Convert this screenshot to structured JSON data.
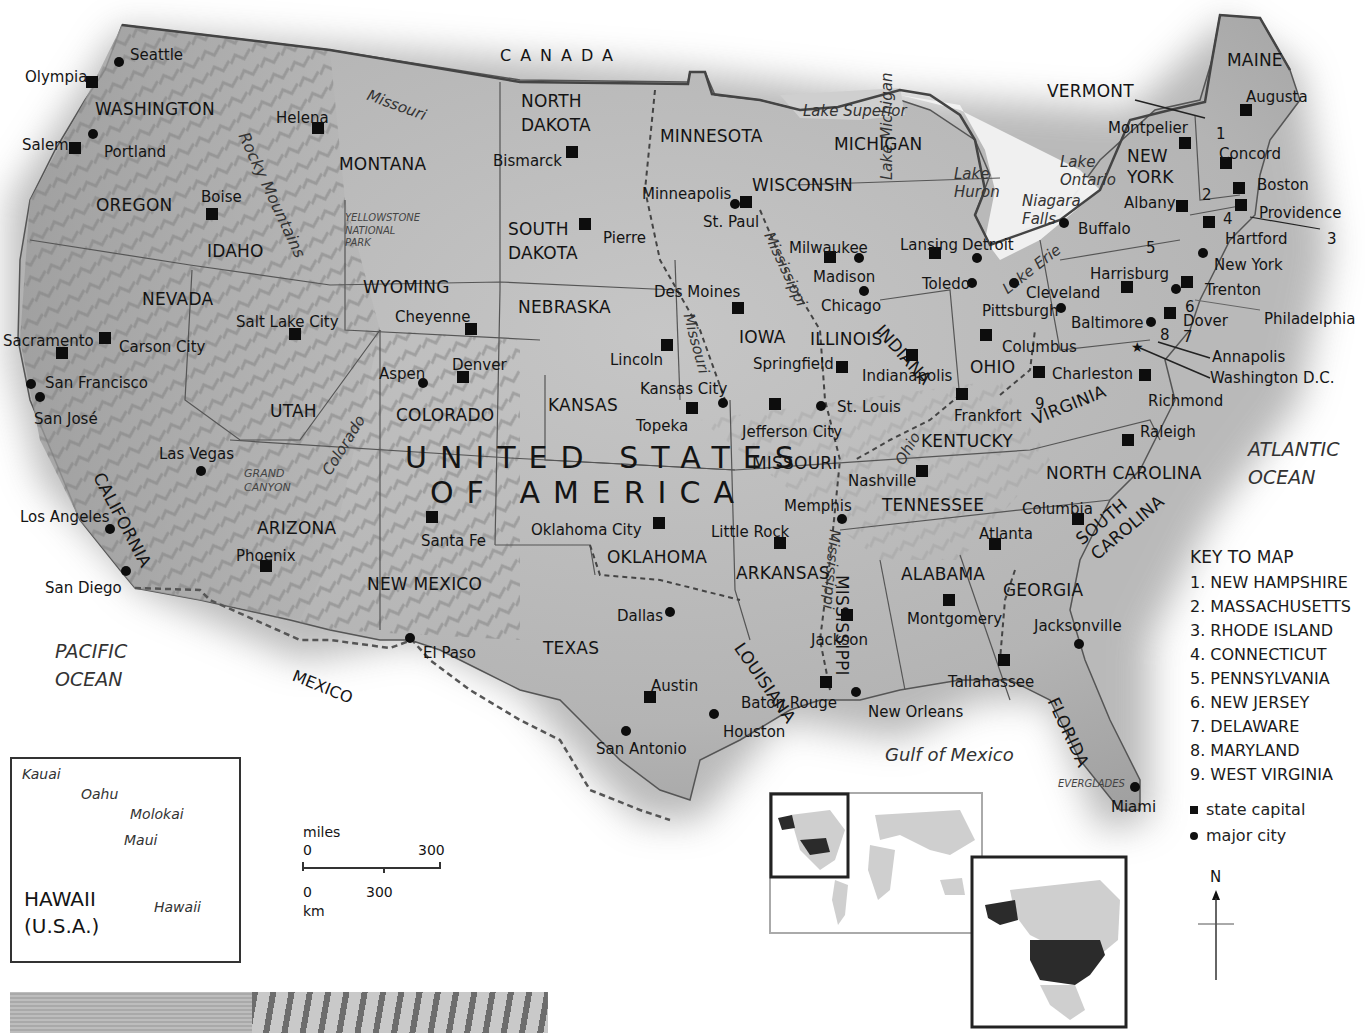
{
  "map": {
    "title": "UNITED STATES OF AMERICA",
    "title_line1": "UNITED STATES",
    "title_line2": "OF AMERICA",
    "neighbors": {
      "north": "CANADA",
      "south": "MEXICO"
    },
    "water_bodies": {
      "pacific_ocean": [
        "PACIFIC",
        "OCEAN"
      ],
      "atlantic_ocean": [
        "ATLANTIC",
        "OCEAN"
      ],
      "gulf": "Gulf of Mexico",
      "lake_superior": "Lake Superior",
      "lake_michigan": "Lake Michigan",
      "lake_huron": [
        "Lake",
        "Huron"
      ],
      "lake_ontario": [
        "Lake",
        "Ontario"
      ],
      "lake_erie": "Lake Erie",
      "niagara_falls": [
        "Niagara",
        "Falls"
      ]
    },
    "rivers": [
      "Missouri",
      "Missouri",
      "Mississippi",
      "Mississippi",
      "Colorado",
      "Ohio"
    ],
    "mountains": "Rocky Mountains",
    "regions": {
      "yellowstone": [
        "YELLOWSTONE",
        "NATIONAL",
        "PARK"
      ],
      "grand_canyon": [
        "GRAND",
        "CANYON"
      ],
      "everglades": "EVERGLADES"
    },
    "states": [
      {
        "name": "WASHINGTON",
        "x": 95,
        "y": 101
      },
      {
        "name": "OREGON",
        "x": 96,
        "y": 197
      },
      {
        "name": "IDAHO",
        "x": 207,
        "y": 243
      },
      {
        "name": "MONTANA",
        "x": 339,
        "y": 156
      },
      {
        "name": "NEVADA",
        "x": 142,
        "y": 291
      },
      {
        "name": "UTAH",
        "x": 270,
        "y": 403
      },
      {
        "name": "ARIZONA",
        "x": 257,
        "y": 520
      },
      {
        "name": "WYOMING",
        "x": 363,
        "y": 279
      },
      {
        "name": "COLORADO",
        "x": 396,
        "y": 407
      },
      {
        "name": "NEW MEXICO",
        "x": 367,
        "y": 576
      },
      {
        "name": "NORTH",
        "x": 521,
        "y": 93
      },
      {
        "name": "DAKOTA",
        "x": 521,
        "y": 117
      },
      {
        "name": "SOUTH",
        "x": 508,
        "y": 221
      },
      {
        "name": "DAKOTA",
        "x": 508,
        "y": 245
      },
      {
        "name": "NEBRASKA",
        "x": 518,
        "y": 299
      },
      {
        "name": "KANSAS",
        "x": 548,
        "y": 397
      },
      {
        "name": "OKLAHOMA",
        "x": 607,
        "y": 549
      },
      {
        "name": "TEXAS",
        "x": 543,
        "y": 640
      },
      {
        "name": "MINNESOTA",
        "x": 660,
        "y": 128
      },
      {
        "name": "IOWA",
        "x": 739,
        "y": 329
      },
      {
        "name": "MISSOURI",
        "x": 752,
        "y": 455
      },
      {
        "name": "ARKANSAS",
        "x": 736,
        "y": 565
      },
      {
        "name": "WISCONSIN",
        "x": 752,
        "y": 177
      },
      {
        "name": "ILLINOIS",
        "x": 810,
        "y": 331
      },
      {
        "name": "MICHIGAN",
        "x": 834,
        "y": 136
      },
      {
        "name": "OHIO",
        "x": 970,
        "y": 359
      },
      {
        "name": "KENTUCKY",
        "x": 921,
        "y": 433
      },
      {
        "name": "TENNESSEE",
        "x": 882,
        "y": 497
      },
      {
        "name": "ALABAMA",
        "x": 901,
        "y": 566
      },
      {
        "name": "GEORGIA",
        "x": 1003,
        "y": 582
      },
      {
        "name": "NORTH CAROLINA",
        "x": 1046,
        "y": 465
      },
      {
        "name": "NEW",
        "x": 1127,
        "y": 148
      },
      {
        "name": "YORK",
        "x": 1127,
        "y": 169
      },
      {
        "name": "MAINE",
        "x": 1227,
        "y": 52
      },
      {
        "name": "VERMONT",
        "x": 1047,
        "y": 83
      }
    ],
    "rotated_states": [
      {
        "name": "CALIFORNIA",
        "x": 105,
        "y": 470,
        "rot": 62
      },
      {
        "name": "INDIANA",
        "x": 885,
        "y": 322,
        "rot": 48
      },
      {
        "name": "LOUISIANA",
        "x": 745,
        "y": 640,
        "rot": 55
      },
      {
        "name": "MISSISSIPPI",
        "x": 850,
        "y": 575,
        "rot": 90
      },
      {
        "name": "VIRGINIA",
        "x": 1030,
        "y": 412,
        "rot": -22
      },
      {
        "name": "SOUTH",
        "x": 1073,
        "y": 535,
        "rot": -40
      },
      {
        "name": "CAROLINA",
        "x": 1088,
        "y": 550,
        "rot": -40
      },
      {
        "name": "FLORIDA",
        "x": 1060,
        "y": 695,
        "rot": 65
      }
    ],
    "state_numbers": [
      {
        "n": "1",
        "x": 1216,
        "y": 127
      },
      {
        "n": "2",
        "x": 1202,
        "y": 188
      },
      {
        "n": "3",
        "x": 1327,
        "y": 232
      },
      {
        "n": "4",
        "x": 1223,
        "y": 212
      },
      {
        "n": "5",
        "x": 1146,
        "y": 241
      },
      {
        "name_hint": "",
        "n": "6",
        "x": 1185,
        "y": 300
      },
      {
        "n": "7",
        "x": 1183,
        "y": 330
      },
      {
        "n": "8",
        "x": 1160,
        "y": 328
      },
      {
        "n": "9",
        "x": 1035,
        "y": 397
      }
    ],
    "capitals": [
      {
        "name": "Olympia",
        "lx": 25,
        "ly": 70,
        "mx": 92,
        "my": 82
      },
      {
        "name": "Salem",
        "lx": 22,
        "ly": 138,
        "mx": 75,
        "my": 148
      },
      {
        "name": "Helena",
        "lx": 276,
        "ly": 111,
        "mx": 318,
        "my": 128
      },
      {
        "name": "Boise",
        "lx": 201,
        "ly": 190,
        "mx": 212,
        "my": 214
      },
      {
        "name": "Bismarck",
        "lx": 493,
        "ly": 154,
        "mx": 572,
        "my": 152
      },
      {
        "name": "Pierre",
        "lx": 603,
        "ly": 231,
        "mx": 585,
        "my": 224
      },
      {
        "name": "St. Paul",
        "lx": 703,
        "ly": 215,
        "mx": 746,
        "my": 202
      },
      {
        "name": "Cheyenne",
        "lx": 395,
        "ly": 310,
        "mx": 471,
        "my": 329
      },
      {
        "name": "Salt Lake City",
        "lx": 236,
        "ly": 315,
        "mx": 295,
        "my": 334
      },
      {
        "name": "Carson City",
        "lx": 119,
        "ly": 340,
        "mx": 105,
        "my": 338
      },
      {
        "name": "Sacramento",
        "lx": 3,
        "ly": 334,
        "mx": 62,
        "my": 353
      },
      {
        "name": "Denver",
        "lx": 452,
        "ly": 358,
        "mx": 463,
        "my": 377
      },
      {
        "name": "Lincoln",
        "lx": 610,
        "ly": 353,
        "mx": 667,
        "my": 345
      },
      {
        "name": "Des Moines",
        "lx": 654,
        "ly": 285,
        "mx": 738,
        "my": 308
      },
      {
        "name": "Madison",
        "lx": 813,
        "ly": 270,
        "mx": 830,
        "my": 257
      },
      {
        "name": "Lansing",
        "lx": 900,
        "ly": 238,
        "mx": 935,
        "my": 253
      },
      {
        "name": "Springfield",
        "lx": 753,
        "ly": 357,
        "mx": 842,
        "my": 367
      },
      {
        "name": "Indianapolis",
        "lx": 862,
        "ly": 369,
        "mx": 912,
        "my": 355
      },
      {
        "name": "Columbus",
        "lx": 1002,
        "ly": 340,
        "mx": 986,
        "my": 335
      },
      {
        "name": "Charleston",
        "lx": 1052,
        "ly": 367,
        "mx": 1039,
        "my": 372
      },
      {
        "name": "Frankfort",
        "lx": 954,
        "ly": 409,
        "mx": 962,
        "my": 394
      },
      {
        "name": "Nashville",
        "lx": 848,
        "ly": 474,
        "mx": 922,
        "my": 471
      },
      {
        "name": "Jefferson City",
        "lx": 742,
        "ly": 425,
        "mx": 775,
        "my": 404
      },
      {
        "name": "Topeka",
        "lx": 636,
        "ly": 419,
        "mx": 692,
        "my": 408
      },
      {
        "name": "Oklahoma City",
        "lx": 531,
        "ly": 523,
        "mx": 659,
        "my": 523
      },
      {
        "name": "Santa Fe",
        "lx": 421,
        "ly": 534,
        "mx": 432,
        "my": 517
      },
      {
        "name": "Phoenix",
        "lx": 236,
        "ly": 549,
        "mx": 266,
        "my": 566
      },
      {
        "name": "Little Rock",
        "lx": 711,
        "ly": 525,
        "mx": 780,
        "my": 543
      },
      {
        "name": "Jackson",
        "lx": 811,
        "ly": 633,
        "mx": 847,
        "my": 615
      },
      {
        "name": "Baton Rouge",
        "lx": 741,
        "ly": 696,
        "mx": 826,
        "my": 682
      },
      {
        "name": "Austin",
        "lx": 651,
        "ly": 679,
        "mx": 650,
        "my": 697
      },
      {
        "name": "Montgomery",
        "lx": 907,
        "ly": 612,
        "mx": 949,
        "my": 600
      },
      {
        "name": "Atlanta",
        "lx": 979,
        "ly": 527,
        "mx": 995,
        "my": 544
      },
      {
        "name": "Tallahassee",
        "lx": 948,
        "ly": 675,
        "mx": 1004,
        "my": 660
      },
      {
        "name": "Columbia",
        "lx": 1022,
        "ly": 502,
        "mx": 1078,
        "my": 519
      },
      {
        "name": "Raleigh",
        "lx": 1140,
        "ly": 425,
        "mx": 1128,
        "my": 440
      },
      {
        "name": "Richmond",
        "lx": 1148,
        "ly": 394,
        "mx": 1145,
        "my": 375
      },
      {
        "name": "Harrisburg",
        "lx": 1090,
        "ly": 267,
        "mx": 1127,
        "my": 287
      },
      {
        "name": "Trenton",
        "lx": 1205,
        "ly": 283,
        "mx": 1187,
        "my": 282
      },
      {
        "name": "Dover",
        "lx": 1183,
        "ly": 314,
        "mx": 1170,
        "my": 313
      },
      {
        "name": "Albany",
        "lx": 1124,
        "ly": 196,
        "mx": 1182,
        "my": 206
      },
      {
        "name": "Montpelier",
        "lx": 1108,
        "ly": 121,
        "mx": 1185,
        "my": 143
      },
      {
        "name": "Concord",
        "lx": 1219,
        "ly": 147,
        "mx": 1226,
        "my": 163
      },
      {
        "name": "Boston",
        "lx": 1257,
        "ly": 178,
        "mx": 1239,
        "my": 188
      },
      {
        "name": "Providence",
        "lx": 1259,
        "ly": 206,
        "mx": 1241,
        "my": 205
      },
      {
        "name": "Hartford",
        "lx": 1225,
        "ly": 232,
        "mx": 1209,
        "my": 222
      },
      {
        "name": "Augusta",
        "lx": 1246,
        "ly": 90,
        "mx": 1246,
        "my": 110
      },
      {
        "name": "Honolulu",
        "lx": 32,
        "ly": 815,
        "mx": 96,
        "my": 802
      }
    ],
    "cities": [
      {
        "name": "Seattle",
        "lx": 130,
        "ly": 48,
        "mx": 119,
        "my": 62
      },
      {
        "name": "Portland",
        "lx": 104,
        "ly": 145,
        "mx": 93,
        "my": 134
      },
      {
        "name": "San Francisco",
        "lx": 45,
        "ly": 376,
        "mx": 31,
        "my": 384
      },
      {
        "name": "San José",
        "lx": 34,
        "ly": 412,
        "mx": 40,
        "my": 397
      },
      {
        "name": "Los Angeles",
        "lx": 20,
        "ly": 510,
        "mx": 110,
        "my": 529
      },
      {
        "name": "San Diego",
        "lx": 45,
        "ly": 581,
        "mx": 126,
        "my": 571
      },
      {
        "name": "Las Vegas",
        "lx": 159,
        "ly": 447,
        "mx": 201,
        "my": 471
      },
      {
        "name": "Aspen",
        "lx": 379,
        "ly": 367,
        "mx": 423,
        "my": 383
      },
      {
        "name": "El Paso",
        "lx": 423,
        "ly": 646,
        "mx": 410,
        "my": 638
      },
      {
        "name": "Minneapolis",
        "lx": 642,
        "ly": 187,
        "mx": 735,
        "my": 204
      },
      {
        "name": "Milwaukee",
        "lx": 789,
        "ly": 241,
        "mx": 859,
        "my": 258
      },
      {
        "name": "Chicago",
        "lx": 821,
        "ly": 299,
        "mx": 864,
        "my": 291
      },
      {
        "name": "Detroit",
        "lx": 962,
        "ly": 238,
        "mx": 977,
        "my": 258
      },
      {
        "name": "Toledo",
        "lx": 922,
        "ly": 277,
        "mx": 972,
        "my": 283
      },
      {
        "name": "Cleveland",
        "lx": 1026,
        "ly": 286,
        "mx": 1014,
        "my": 283
      },
      {
        "name": "Pittsburgh",
        "lx": 982,
        "ly": 304,
        "mx": 1061,
        "my": 308
      },
      {
        "name": "Baltimore",
        "lx": 1071,
        "ly": 316,
        "mx": 1151,
        "my": 322
      },
      {
        "name": "Kansas City",
        "lx": 640,
        "ly": 382,
        "mx": 723,
        "my": 403
      },
      {
        "name": "St. Louis",
        "lx": 837,
        "ly": 400,
        "mx": 821,
        "my": 406
      },
      {
        "name": "Memphis",
        "lx": 784,
        "ly": 499,
        "mx": 842,
        "my": 519
      },
      {
        "name": "Dallas",
        "lx": 617,
        "ly": 609,
        "mx": 670,
        "my": 612
      },
      {
        "name": "Houston",
        "lx": 723,
        "ly": 725,
        "mx": 714,
        "my": 714
      },
      {
        "name": "San Antonio",
        "lx": 596,
        "ly": 742,
        "mx": 626,
        "my": 731
      },
      {
        "name": "New Orleans",
        "lx": 868,
        "ly": 705,
        "mx": 856,
        "my": 692
      },
      {
        "name": "Jacksonville",
        "lx": 1034,
        "ly": 619,
        "mx": 1079,
        "my": 644
      },
      {
        "name": "Miami",
        "lx": 1111,
        "ly": 800,
        "mx": 1135,
        "my": 787
      },
      {
        "name": "Buffalo",
        "lx": 1078,
        "ly": 222,
        "mx": 1064,
        "my": 223
      },
      {
        "name": "New York",
        "lx": 1214,
        "ly": 258,
        "mx": 1203,
        "my": 253
      },
      {
        "name": "Philadelphia",
        "lx": 1264,
        "ly": 312,
        "mx": 1176,
        "my": 289
      }
    ],
    "callouts": {
      "annapolis": "Annapolis",
      "washington_dc": "Washington D.C."
    }
  },
  "key": {
    "title": "KEY TO MAP",
    "items": [
      "1. NEW HAMPSHIRE",
      "2. MASSACHUSETTS",
      "3. RHODE ISLAND",
      "4. CONNECTICUT",
      "5. PENNSYLVANIA",
      "6. NEW JERSEY",
      "7. DELAWARE",
      "8. MARYLAND",
      "9. WEST VIRGINIA"
    ],
    "legend": {
      "state_capital": "state capital",
      "major_city": "major city"
    }
  },
  "hawaii_inset": {
    "title_line1": "HAWAII",
    "title_line2": "(U.S.A.)",
    "islands": [
      "Kauai",
      "Oahu",
      "Molokai",
      "Maui",
      "Hawaii"
    ],
    "capital": "Honolulu"
  },
  "scale_bar": {
    "miles_label": "miles",
    "miles_start": "0",
    "miles_end": "300",
    "km_start": "0",
    "km_mid": "300",
    "km_label": "km"
  },
  "compass": {
    "north_label": "N"
  },
  "colors": {
    "land": "#bdbdbd",
    "land_dark": "#8f8f8f",
    "background": "#ffffff",
    "highlight_usa": "#2b2b2b",
    "world_land": "#cfcfcf",
    "border": "#333333"
  }
}
